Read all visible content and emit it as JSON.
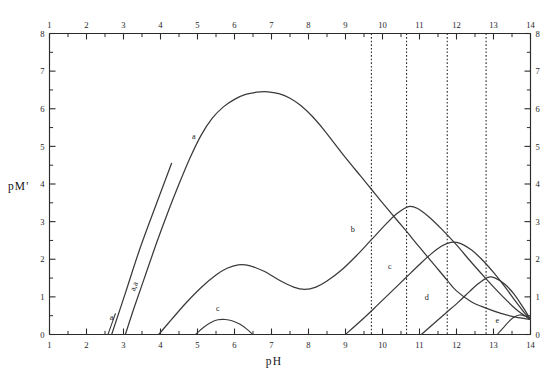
{
  "figure": {
    "title": "",
    "x_axis_label": "pH",
    "y_axis_label": "pM'"
  },
  "axes": {
    "x_ticks_top": [
      "1",
      "2",
      "3",
      "4",
      "5",
      "6",
      "7",
      "8",
      "9",
      "10",
      "11",
      "12",
      "13",
      "14"
    ],
    "x_ticks_bottom": [
      "1",
      "2",
      "3",
      "4",
      "5",
      "6",
      "7",
      "8",
      "9",
      "10",
      "11",
      "12",
      "13",
      "14"
    ],
    "y_ticks_left": [
      "8",
      "7",
      "6",
      "5",
      "4",
      "3",
      "2",
      "1",
      "0"
    ],
    "y_ticks_right": [
      "8",
      "7",
      "6",
      "5",
      "4",
      "3",
      "2",
      "1",
      "0"
    ]
  },
  "curve_labels": {
    "a_main": "a",
    "a_steep": "a,a",
    "a_small": "a",
    "b": "b",
    "c_upper": "c",
    "c_lower": "c",
    "d": "d",
    "e": "e"
  },
  "chart_data": {
    "type": "line",
    "title": "",
    "xlabel": "pH",
    "ylabel": "pM'",
    "xlim": [
      1,
      14
    ],
    "ylim": [
      0,
      8
    ],
    "grid": false,
    "legend": "none",
    "x_tick_interval": 1,
    "x_minor_tick_interval": 0.5,
    "y_tick_interval": 1,
    "y_minor_tick_interval": 0.5,
    "axis_labels_on": [
      "top",
      "bottom",
      "left",
      "right"
    ],
    "annotations": [
      {
        "label": "a",
        "x": 4.9,
        "y": 5.2
      },
      {
        "label": "a,a",
        "x": 3.35,
        "y": 1.25
      },
      {
        "label": "a",
        "x": 2.68,
        "y": 0.38
      },
      {
        "label": "b",
        "x": 9.2,
        "y": 2.72
      },
      {
        "label": "c",
        "x": 10.2,
        "y": 1.75
      },
      {
        "label": "c",
        "x": 5.55,
        "y": 0.62
      },
      {
        "label": "d",
        "x": 11.2,
        "y": 0.92
      },
      {
        "label": "e",
        "x": 13.1,
        "y": 0.3
      }
    ],
    "vertical_dotted_lines": {
      "x_values": [
        9.7,
        10.65,
        11.75,
        12.8
      ],
      "y_from": 0,
      "y_to": 8
    },
    "series": [
      {
        "name": "a",
        "style": "solid",
        "comment": "main envelope curve: rises steeply from pH 3.05, broad maximum ~6.45 near pH 6.8, then falls linearly to 0.4 at pH 14",
        "points": [
          [
            3.05,
            0.0
          ],
          [
            3.3,
            0.75
          ],
          [
            3.6,
            1.6
          ],
          [
            3.9,
            2.45
          ],
          [
            4.2,
            3.25
          ],
          [
            4.5,
            4.0
          ],
          [
            4.8,
            4.7
          ],
          [
            5.1,
            5.3
          ],
          [
            5.4,
            5.75
          ],
          [
            5.7,
            6.05
          ],
          [
            6.0,
            6.25
          ],
          [
            6.3,
            6.38
          ],
          [
            6.6,
            6.44
          ],
          [
            6.9,
            6.45
          ],
          [
            7.2,
            6.4
          ],
          [
            7.5,
            6.28
          ],
          [
            7.8,
            6.08
          ],
          [
            8.1,
            5.8
          ],
          [
            8.4,
            5.46
          ],
          [
            8.7,
            5.08
          ],
          [
            9.0,
            4.7
          ],
          [
            9.4,
            4.22
          ],
          [
            9.7,
            3.86
          ],
          [
            10.0,
            3.5
          ],
          [
            10.4,
            3.03
          ],
          [
            10.7,
            2.68
          ],
          [
            11.0,
            2.32
          ],
          [
            11.4,
            1.85
          ],
          [
            11.75,
            1.44
          ],
          [
            12.0,
            1.16
          ],
          [
            12.4,
            0.87
          ],
          [
            12.8,
            0.7
          ],
          [
            13.2,
            0.56
          ],
          [
            13.6,
            0.46
          ],
          [
            14.0,
            0.4
          ]
        ]
      },
      {
        "name": "a,a",
        "style": "solid",
        "comment": "steep straight line segment rising from pH 2.68 baseline into the a curve",
        "points": [
          [
            2.68,
            0.0
          ],
          [
            3.05,
            1.1
          ],
          [
            3.45,
            2.3
          ],
          [
            3.9,
            3.5
          ],
          [
            4.3,
            4.55
          ]
        ]
      },
      {
        "name": "a-small",
        "style": "solid",
        "comment": "short line at the far left starting on the baseline near pH 2.6",
        "points": [
          [
            2.58,
            0.0
          ],
          [
            2.78,
            0.55
          ]
        ]
      },
      {
        "name": "b",
        "style": "solid",
        "comment": "rises from pH 3.95, local max 1.85 at pH 6.2, dip 1.2 at pH 7.8, second max 3.4 at pH 10.7, then falls to 0.4 at pH 14",
        "points": [
          [
            3.95,
            0.0
          ],
          [
            4.3,
            0.4
          ],
          [
            4.7,
            0.85
          ],
          [
            5.1,
            1.25
          ],
          [
            5.5,
            1.58
          ],
          [
            5.8,
            1.76
          ],
          [
            6.1,
            1.85
          ],
          [
            6.4,
            1.83
          ],
          [
            6.8,
            1.68
          ],
          [
            7.2,
            1.45
          ],
          [
            7.6,
            1.26
          ],
          [
            7.9,
            1.2
          ],
          [
            8.2,
            1.26
          ],
          [
            8.5,
            1.42
          ],
          [
            8.9,
            1.72
          ],
          [
            9.3,
            2.1
          ],
          [
            9.7,
            2.52
          ],
          [
            10.1,
            2.94
          ],
          [
            10.4,
            3.22
          ],
          [
            10.7,
            3.4
          ],
          [
            10.95,
            3.35
          ],
          [
            11.25,
            3.13
          ],
          [
            11.6,
            2.8
          ],
          [
            12.0,
            2.38
          ],
          [
            12.4,
            1.92
          ],
          [
            12.8,
            1.48
          ],
          [
            13.2,
            1.06
          ],
          [
            13.6,
            0.68
          ],
          [
            14.0,
            0.4
          ]
        ]
      },
      {
        "name": "c-upper",
        "style": "solid",
        "comment": "rises linearly from pH 9.0 baseline to max 2.45 at pH 11.85, then falls to 0.4 at pH 14",
        "points": [
          [
            9.0,
            0.0
          ],
          [
            9.4,
            0.35
          ],
          [
            9.8,
            0.72
          ],
          [
            10.2,
            1.1
          ],
          [
            10.6,
            1.48
          ],
          [
            11.0,
            1.86
          ],
          [
            11.3,
            2.13
          ],
          [
            11.6,
            2.35
          ],
          [
            11.85,
            2.45
          ],
          [
            12.1,
            2.42
          ],
          [
            12.4,
            2.25
          ],
          [
            12.7,
            1.98
          ],
          [
            13.0,
            1.65
          ],
          [
            13.3,
            1.28
          ],
          [
            13.6,
            0.88
          ],
          [
            13.85,
            0.56
          ],
          [
            14.0,
            0.4
          ]
        ]
      },
      {
        "name": "c-lower",
        "style": "solid",
        "comment": "small hump between pH 4.95 and 6.55 with peak 0.40 at pH 5.65",
        "points": [
          [
            4.95,
            0.0
          ],
          [
            5.15,
            0.18
          ],
          [
            5.35,
            0.31
          ],
          [
            5.55,
            0.39
          ],
          [
            5.75,
            0.4
          ],
          [
            5.95,
            0.36
          ],
          [
            6.15,
            0.27
          ],
          [
            6.35,
            0.13
          ],
          [
            6.55,
            -0.05
          ]
        ]
      },
      {
        "name": "d",
        "style": "solid",
        "comment": "rises from pH 11.05 baseline to max 1.52 at pH 12.85, then falls to 0.4 at pH 14",
        "points": [
          [
            11.05,
            0.0
          ],
          [
            11.35,
            0.26
          ],
          [
            11.7,
            0.56
          ],
          [
            12.05,
            0.86
          ],
          [
            12.35,
            1.14
          ],
          [
            12.6,
            1.36
          ],
          [
            12.85,
            1.52
          ],
          [
            13.05,
            1.5
          ],
          [
            13.3,
            1.34
          ],
          [
            13.55,
            1.08
          ],
          [
            13.8,
            0.72
          ],
          [
            14.0,
            0.4
          ]
        ]
      },
      {
        "name": "e",
        "style": "solid",
        "comment": "small rise from pH 13.1 to max 0.52 at pH 13.7, then down to 0.4 at pH 14",
        "points": [
          [
            13.1,
            0.0
          ],
          [
            13.25,
            0.16
          ],
          [
            13.4,
            0.33
          ],
          [
            13.55,
            0.46
          ],
          [
            13.7,
            0.52
          ],
          [
            13.85,
            0.49
          ],
          [
            14.0,
            0.4
          ]
        ]
      }
    ]
  }
}
